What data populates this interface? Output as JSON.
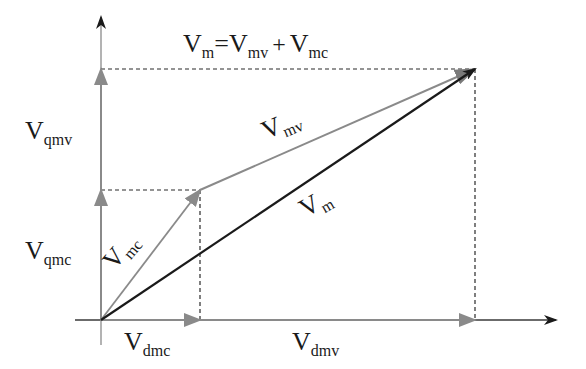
{
  "diagram": {
    "type": "phasor-vector-diagram",
    "colors": {
      "axis": "#3a3a3a",
      "resultant": "#1a1a1a",
      "component": "#8a8a8a",
      "dashed": "#2a2a2a",
      "text": "#1a1a1a"
    },
    "equation": {
      "v1": "V",
      "s1": "m",
      "eq": "=",
      "v2": "V",
      "s2": "mv",
      "plus": "+",
      "v3": "V",
      "s3": "mc"
    },
    "labels": {
      "vqmv": {
        "main": "V",
        "sub": "qmv"
      },
      "vqmc": {
        "main": "V",
        "sub": "qmc"
      },
      "vmv": {
        "main": "V",
        "sub": "mv"
      },
      "vmc": {
        "main": "V",
        "sub": "mc"
      },
      "vm": {
        "main": "V",
        "sub": "m"
      },
      "vdmc": {
        "main": "V",
        "sub": "dmc"
      },
      "vdmv": {
        "main": "V",
        "sub": "dmv"
      }
    },
    "vectors": [
      {
        "name": "Vmc",
        "from": [
          101,
          320
        ],
        "to": [
          200,
          190
        ],
        "color": "component"
      },
      {
        "name": "Vmv",
        "from": [
          200,
          190
        ],
        "to": [
          475,
          69
        ],
        "color": "component"
      },
      {
        "name": "Vm",
        "from": [
          101,
          320
        ],
        "to": [
          475,
          69
        ],
        "color": "resultant"
      },
      {
        "name": "Vdmc",
        "from": [
          101,
          320
        ],
        "to": [
          200,
          320
        ],
        "color": "component"
      },
      {
        "name": "Vdmv",
        "from": [
          200,
          320
        ],
        "to": [
          475,
          320
        ],
        "color": "component"
      },
      {
        "name": "Vqmc",
        "from": [
          101,
          320
        ],
        "to": [
          101,
          190
        ],
        "color": "component"
      },
      {
        "name": "Vqmv",
        "from": [
          101,
          190
        ],
        "to": [
          101,
          69
        ],
        "color": "component"
      }
    ]
  }
}
